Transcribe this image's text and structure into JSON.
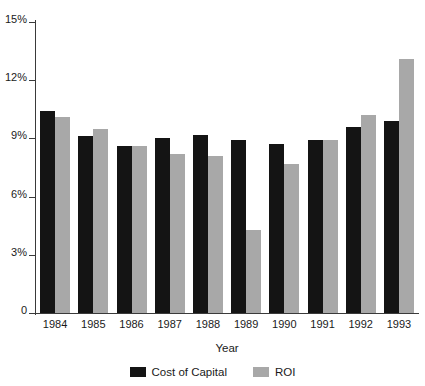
{
  "chart_data": {
    "type": "bar",
    "title": "",
    "xlabel": "Year",
    "ylabel": "",
    "categories": [
      "1984",
      "1985",
      "1986",
      "1987",
      "1988",
      "1989",
      "1990",
      "1991",
      "1992",
      "1993"
    ],
    "series": [
      {
        "name": "Cost of Capital",
        "color": "#141414",
        "values": [
          10.4,
          9.1,
          8.6,
          9.0,
          9.2,
          8.9,
          8.7,
          8.9,
          9.6,
          9.9
        ]
      },
      {
        "name": "ROI",
        "color": "#a8a8a8",
        "values": [
          10.1,
          9.5,
          8.6,
          8.2,
          8.1,
          4.3,
          7.7,
          8.9,
          10.2,
          13.1
        ]
      }
    ],
    "ylim": [
      0,
      15
    ],
    "yticks": [
      0,
      3,
      6,
      9,
      12,
      15
    ],
    "ytick_labels": [
      "0",
      "3%",
      "6%",
      "9%",
      "12%",
      "15%"
    ],
    "grid": false,
    "legend_position": "bottom"
  }
}
